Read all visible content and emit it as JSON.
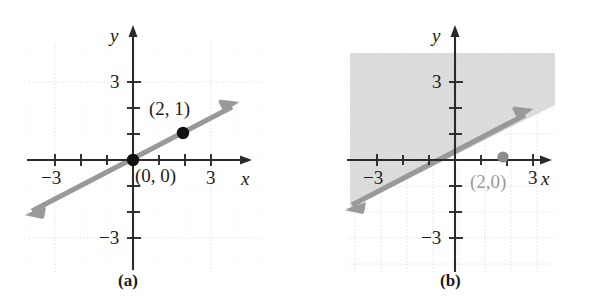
{
  "figure": {
    "panels": [
      {
        "id": "a",
        "caption": "(a)",
        "axes": {
          "x_label": "x",
          "y_label": "y",
          "x_ticks": [
            {
              "value": -3,
              "label": "−3"
            },
            {
              "value": 3,
              "label": "3"
            }
          ],
          "y_ticks": [
            {
              "value": 3,
              "label": "3"
            },
            {
              "value": -3,
              "label": "−3"
            }
          ],
          "xlim": [
            -4.2,
            4.4
          ],
          "ylim": [
            -4.3,
            5.1
          ],
          "grid": "dotted"
        },
        "line": {
          "slope": 0.5,
          "intercept": 0,
          "color": "#999999",
          "arrow_both_ends": true
        },
        "points": [
          {
            "label": "(2, 1)",
            "x": 2,
            "y": 1,
            "color": "#111111",
            "label_color": "#1a1a1a"
          },
          {
            "label": "(0, 0)",
            "x": 0,
            "y": 0,
            "color": "#111111",
            "label_color": "#1a1a1a"
          }
        ],
        "shaded_region": null
      },
      {
        "id": "b",
        "caption": "(b)",
        "axes": {
          "x_label": "x",
          "y_label": "y",
          "x_ticks": [
            {
              "value": -3,
              "label": "−3"
            },
            {
              "value": 3,
              "label": "3"
            }
          ],
          "y_ticks": [
            {
              "value": 3,
              "label": "3"
            },
            {
              "value": -3,
              "label": "−3"
            }
          ],
          "xlim": [
            -4.2,
            4.4
          ],
          "ylim": [
            -4.3,
            5.1
          ],
          "grid": "dotted"
        },
        "line": {
          "slope": 0.5,
          "intercept": 0,
          "color": "#999999",
          "arrow_both_ends": true
        },
        "points": [
          {
            "label": "(2,0)",
            "x": 2,
            "y": 0,
            "color": "#8c8c8c",
            "label_color": "#9a9a9a"
          }
        ],
        "shaded_region": {
          "description": "region above the line",
          "color": "#dcdcdc"
        }
      }
    ],
    "colors": {
      "line": "#999999",
      "axis": "#2a2a2a",
      "shade": "#dcdcdc",
      "grid": "#e3e3e3",
      "point_dark": "#111111",
      "point_muted": "#8c8c8c",
      "text": "#1a1a1a",
      "text_muted": "#9a9a9a"
    }
  }
}
